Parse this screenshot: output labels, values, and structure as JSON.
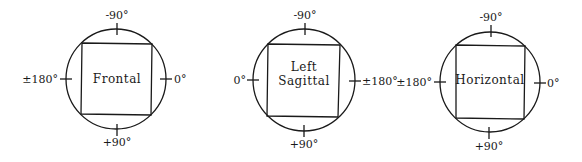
{
  "diagrams": [
    {
      "name": "frontal",
      "title_lines": [
        "Frontal"
      ],
      "labels": {
        "top": "-90°",
        "bottom": "+90°",
        "left": "±180°",
        "right": "0°"
      }
    },
    {
      "name": "left-sagittal",
      "title_lines": [
        "Left",
        "Sagittal"
      ],
      "labels": {
        "top": "-90°",
        "bottom": "+90°",
        "left": "0°",
        "right": "±180°"
      }
    },
    {
      "name": "horizontal",
      "title_lines": [
        "Horizontal"
      ],
      "labels": {
        "top": "-90°",
        "bottom": "+90°",
        "left": "±180°",
        "right": "0°"
      }
    }
  ],
  "colors": {
    "line": "#1a1a1a",
    "background": "#ffffff"
  }
}
